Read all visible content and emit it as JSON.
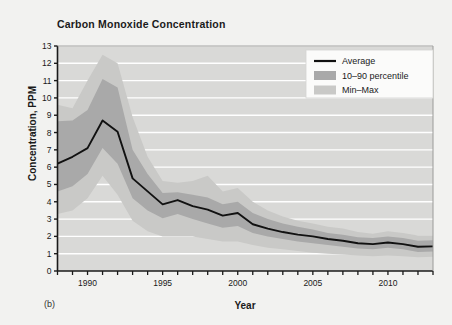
{
  "figure": {
    "panel_label": "(b)"
  },
  "chart_data": {
    "type": "line",
    "title": "Carbon Monoxide Concentration",
    "xlabel": "Year",
    "ylabel": "Concentration, PPM",
    "xlim": [
      1988,
      2013
    ],
    "ylim": [
      0,
      13
    ],
    "grid": true,
    "grid_color": "#ffffff",
    "plot_background": "#d9d9d7",
    "legend_position": "top-right",
    "x": [
      1988,
      1989,
      1990,
      1991,
      1992,
      1993,
      1994,
      1995,
      1996,
      1997,
      1998,
      1999,
      2000,
      2001,
      2002,
      2003,
      2004,
      2005,
      2006,
      2007,
      2008,
      2009,
      2010,
      2011,
      2012,
      2013
    ],
    "xticks": [
      1990,
      1995,
      2000,
      2005,
      2010
    ],
    "xtick_labels": [
      "1990",
      "1995",
      "2000",
      "2005",
      "2010"
    ],
    "yticks": [
      0,
      1,
      2,
      3,
      4,
      5,
      6,
      7,
      8,
      9,
      10,
      11,
      12,
      13
    ],
    "ytick_labels": [
      "0",
      "1",
      "2",
      "3",
      "4",
      "5",
      "6",
      "7",
      "8",
      "9",
      "10",
      "11",
      "12",
      "13"
    ],
    "series": [
      {
        "name": "Average",
        "kind": "line",
        "color": "#111111",
        "values": [
          6.2,
          6.6,
          7.1,
          8.7,
          8.05,
          5.35,
          4.6,
          3.85,
          4.1,
          3.75,
          3.55,
          3.2,
          3.35,
          2.7,
          2.45,
          2.25,
          2.1,
          2.0,
          1.85,
          1.75,
          1.6,
          1.55,
          1.65,
          1.55,
          1.4,
          1.42
        ]
      },
      {
        "name": "10–90 percentile",
        "kind": "band",
        "color": "#a9a9a9",
        "lower": [
          4.6,
          4.9,
          5.6,
          7.1,
          6.2,
          4.2,
          3.5,
          3.05,
          3.3,
          3.0,
          2.75,
          2.5,
          2.6,
          2.2,
          2.0,
          1.85,
          1.7,
          1.6,
          1.5,
          1.4,
          1.3,
          1.25,
          1.35,
          1.25,
          1.1,
          1.12
        ],
        "upper": [
          8.65,
          8.7,
          9.3,
          11.1,
          10.6,
          7.0,
          5.6,
          4.5,
          4.55,
          4.4,
          4.25,
          3.85,
          4.0,
          3.35,
          3.0,
          2.75,
          2.55,
          2.4,
          2.2,
          2.1,
          1.95,
          1.9,
          2.0,
          1.9,
          1.75,
          1.78
        ]
      },
      {
        "name": "Min–Max",
        "kind": "band",
        "color": "#c9c9c7",
        "lower": [
          3.3,
          3.5,
          4.2,
          5.5,
          4.4,
          2.9,
          2.3,
          2.0,
          2.0,
          2.0,
          1.85,
          1.7,
          1.7,
          1.5,
          1.35,
          1.25,
          1.15,
          1.05,
          1.0,
          0.95,
          0.9,
          0.85,
          0.9,
          0.85,
          0.8,
          0.82
        ],
        "upper": [
          9.6,
          9.4,
          11.0,
          12.5,
          12.0,
          8.9,
          6.6,
          5.2,
          5.1,
          5.2,
          5.5,
          4.6,
          4.8,
          4.0,
          3.5,
          3.15,
          2.9,
          2.75,
          2.55,
          2.45,
          2.25,
          2.15,
          2.3,
          2.2,
          2.05,
          2.05
        ]
      }
    ],
    "legend": [
      {
        "label": "Average",
        "swatch": "line",
        "color": "#111111"
      },
      {
        "label": "10–90 percentile",
        "swatch": "patch",
        "color": "#a9a9a9"
      },
      {
        "label": "Min–Max",
        "swatch": "patch",
        "color": "#c9c9c7"
      }
    ]
  }
}
